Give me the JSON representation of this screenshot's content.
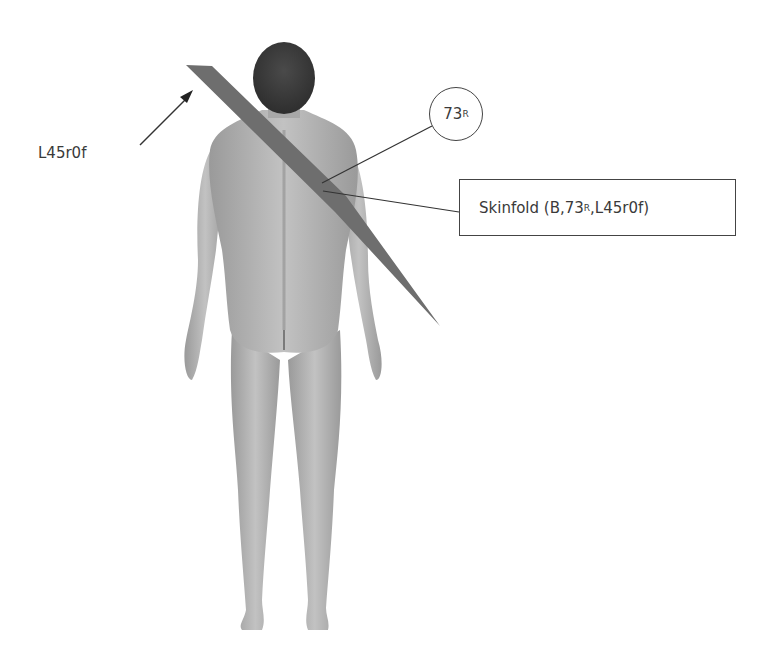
{
  "diagram": {
    "arrow_label": "L45r0f",
    "circle_label": {
      "main": "73",
      "subscript": "R"
    },
    "box_label": {
      "prefix": "Skinfold (B,",
      "number": "73",
      "subscript": "R",
      "suffix": ",L45r0f)"
    },
    "colors": {
      "background": "#ffffff",
      "skinfold_band": "#6e6e6e",
      "hair": "#3c3c3c",
      "skin": "#b5b5b5",
      "skin_shadow": "#8f8f8f",
      "lines": "#333333"
    }
  }
}
